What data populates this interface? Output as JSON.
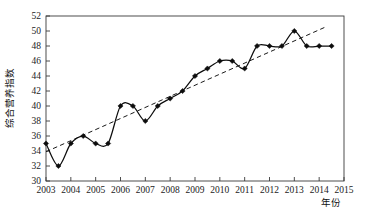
{
  "chart_data": {
    "type": "line",
    "title": "",
    "xlabel": "年份",
    "ylabel": "综合营养指数",
    "xlim": [
      2003,
      2015
    ],
    "ylim": [
      30,
      52
    ],
    "grid": false,
    "legend": "none",
    "x_tick_labels": [
      "2003",
      "2004",
      "2005",
      "2006",
      "2007",
      "2008",
      "2009",
      "2010",
      "2011",
      "2012",
      "2013",
      "2014",
      "2015"
    ],
    "y_tick_labels": [
      "30",
      "32",
      "34",
      "36",
      "38",
      "40",
      "42",
      "44",
      "46",
      "48",
      "50",
      "52"
    ],
    "x_ticks": [
      2003,
      2004,
      2005,
      2006,
      2007,
      2008,
      2009,
      2010,
      2011,
      2012,
      2013,
      2014,
      2015
    ],
    "y_ticks": [
      30,
      32,
      34,
      36,
      38,
      40,
      42,
      44,
      46,
      48,
      50,
      52
    ],
    "series": [
      {
        "name": "综合营养指数",
        "marker": "diamond",
        "color": "#0d0d0d",
        "x": [
          2003,
          2003.5,
          2004,
          2004.5,
          2005,
          2005.5,
          2006,
          2006.5,
          2007,
          2007.5,
          2008,
          2008.5,
          2009,
          2009.5,
          2010,
          2010.5,
          2011,
          2011.5,
          2012,
          2012.5,
          2013,
          2013.5,
          2014,
          2014.5
        ],
        "values": [
          35,
          32,
          35,
          36,
          35,
          35,
          40,
          40,
          38,
          40,
          41,
          42,
          44,
          45,
          46,
          46,
          45,
          48,
          48,
          48,
          50,
          48,
          48,
          48
        ]
      }
    ],
    "trendline": {
      "name": "线性趋势线",
      "style": "dashed",
      "color": "#1a1a1a",
      "x": [
        2003,
        2014.3
      ],
      "values": [
        33.9,
        50.6
      ]
    }
  },
  "axis": {
    "x_title": "年份",
    "y_title": "综合营养指数"
  }
}
